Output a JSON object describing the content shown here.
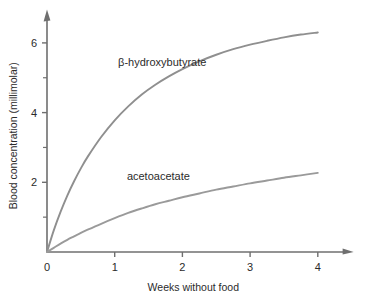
{
  "chart_data": {
    "type": "line",
    "title": "",
    "xlabel": "Weeks without food",
    "ylabel": "Blood concentration (millimolar)",
    "xlim": [
      0,
      4.5
    ],
    "ylim": [
      0,
      6.9
    ],
    "xticks": [
      0,
      1,
      2,
      3,
      4
    ],
    "xtick_labels": [
      "0",
      "1",
      "2",
      "3",
      "4"
    ],
    "yticks": [
      2,
      4,
      6
    ],
    "ytick_labels": [
      "2",
      "4",
      "6"
    ],
    "yticks_minor": [
      1,
      3,
      5
    ],
    "grid": false,
    "legend": "inline-labels",
    "axis_style": "arrow-tipped-left-and-bottom-spines",
    "series": [
      {
        "name": "β-hydroxybutyrate",
        "color": "#8f8f8f",
        "label_x": 1.05,
        "label_y": 5.35,
        "x": [
          0,
          0.1,
          0.2,
          0.3,
          0.4,
          0.5,
          0.6,
          0.8,
          1.0,
          1.2,
          1.4,
          1.6,
          1.8,
          2.0,
          2.25,
          2.5,
          2.75,
          3.0,
          3.25,
          3.5,
          3.75,
          4.0
        ],
        "values": [
          0,
          0.62,
          1.15,
          1.62,
          2.03,
          2.4,
          2.73,
          3.3,
          3.78,
          4.18,
          4.52,
          4.8,
          5.04,
          5.25,
          5.47,
          5.66,
          5.82,
          5.95,
          6.06,
          6.16,
          6.24,
          6.3
        ]
      },
      {
        "name": "acetoacetate",
        "color": "#9a9a9a",
        "label_x": 1.18,
        "label_y": 2.08,
        "x": [
          0,
          0.1,
          0.2,
          0.3,
          0.4,
          0.5,
          0.6,
          0.8,
          1.0,
          1.2,
          1.4,
          1.6,
          1.8,
          2.0,
          2.25,
          2.5,
          2.75,
          3.0,
          3.25,
          3.5,
          3.75,
          4.0
        ],
        "values": [
          0,
          0.12,
          0.24,
          0.35,
          0.45,
          0.55,
          0.64,
          0.81,
          0.97,
          1.12,
          1.25,
          1.37,
          1.47,
          1.57,
          1.68,
          1.79,
          1.88,
          1.97,
          2.05,
          2.13,
          2.2,
          2.27
        ]
      }
    ]
  },
  "colors": {
    "axis": "#6f6f6f",
    "text": "#2b2b2b",
    "background": "#ffffff"
  }
}
